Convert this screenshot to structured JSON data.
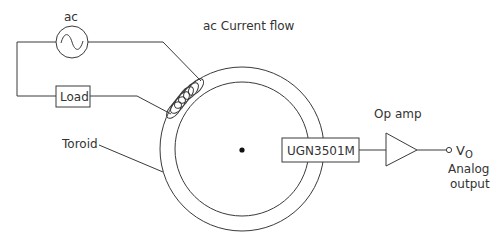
{
  "diagram": {
    "title": "ac Current flow",
    "source": {
      "label": "ac",
      "symbol": "ac-sine-source"
    },
    "load": {
      "label": "Load"
    },
    "toroid": {
      "label": "Toroid"
    },
    "sensor": {
      "label": "UGN3501M"
    },
    "amplifier": {
      "label": "Op amp"
    },
    "output": {
      "symbol_main": "V",
      "symbol_sub": "O",
      "caption_line1": "Analog",
      "caption_line2": "output"
    },
    "colors": {
      "line": "#3a3a3a",
      "text": "#333333",
      "background": "#ffffff",
      "center_dot": "#111111"
    }
  }
}
